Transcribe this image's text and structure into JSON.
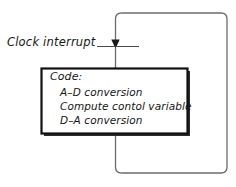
{
  "diagram": {
    "type": "control-flow-block-diagram",
    "signal": {
      "label": "Clock interrupt"
    },
    "code_block": {
      "heading": "Code:",
      "steps": [
        "A–D conversion",
        "Compute contol variable",
        "D–A conversion"
      ]
    },
    "colors": {
      "background": "#ffffff",
      "block_border": "#111111",
      "block_shadow": "#2b2b2b",
      "loop_line": "#6b6b6b",
      "arrow": "#1a1a1a",
      "text": "#161616"
    }
  }
}
